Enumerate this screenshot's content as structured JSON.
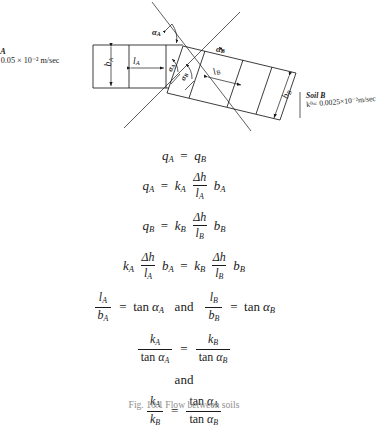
{
  "figure": {
    "caption": "Fig. 10.1   Flow between soils",
    "background": "#ffffff",
    "ink": "#1a1a1a"
  },
  "diagram": {
    "soil_a": {
      "name_line": "il A",
      "perm_line": "= 0.05 × 10⁻² m/sec",
      "full_name": "Soil A",
      "permeability_value": "0.05 × 10⁻² m/sec",
      "clipped_at_left_edge": true
    },
    "soil_b": {
      "name_line": "Soil B",
      "perm_line": "kᴮ= 0.0025×10⁻²m/sec",
      "full_name": "Soil B",
      "permeability_value": "0.0025 × 10⁻² m/sec"
    },
    "dimensions": {
      "b_a": "b",
      "b_a_sub": "A",
      "l_a": "l",
      "l_a_sub": "A",
      "l_b": "l",
      "l_b_sub": "B",
      "b_b": "b",
      "b_b_sub": "B"
    },
    "angles": {
      "alpha_a_top": "α",
      "alpha_a_top_sub": "A",
      "alpha_b_top": "α",
      "alpha_b_top_sub": "B",
      "alpha_a_low": "α",
      "alpha_a_low_sub": "A",
      "alpha_b_low": "α",
      "alpha_b_low_sub": "B"
    }
  },
  "equations": {
    "eq1": {
      "lhs_var": "q",
      "lhs_sub": "A",
      "rhs_var": "q",
      "rhs_sub": "B",
      "sign": "="
    },
    "eq2": {
      "lhs_var": "q",
      "lhs_sub": "A",
      "sign": "=",
      "k_var": "k",
      "k_sub": "A",
      "frac_num": "Δh",
      "frac_den": "l",
      "frac_den_sub": "A",
      "b_var": "b",
      "b_sub": "A"
    },
    "eq3": {
      "lhs_var": "q",
      "lhs_sub": "B",
      "sign": "=",
      "k_var": "k",
      "k_sub": "B",
      "frac_num": "Δh",
      "frac_den": "l",
      "frac_den_sub": "B",
      "b_var": "b",
      "b_sub": "B"
    },
    "eq4": {
      "k_left": "k",
      "k_left_sub": "A",
      "frac_left_num": "Δh",
      "frac_left_den": "l",
      "frac_left_den_sub": "A",
      "b_left": "b",
      "b_left_sub": "A",
      "sign": "=",
      "k_right": "k",
      "k_right_sub": "B",
      "frac_right_num": "Δh",
      "frac_right_den": "l",
      "frac_right_den_sub": "B",
      "b_right": "b",
      "b_right_sub": "B"
    },
    "eq5": {
      "frac_left_num": "l",
      "frac_left_num_sub": "A",
      "frac_left_den": "b",
      "frac_left_den_sub": "A",
      "sign_left": "=",
      "tan_left": "tan",
      "alpha_left": "α",
      "alpha_left_sub": "A",
      "conj": "and",
      "frac_right_num": "l",
      "frac_right_num_sub": "B",
      "frac_right_den": "b",
      "frac_right_den_sub": "B",
      "sign_right": "=",
      "tan_right": "tan",
      "alpha_right": "α",
      "alpha_right_sub": "B"
    },
    "eq6": {
      "left_num": "k",
      "left_num_sub": "A",
      "left_den_tan": "tan",
      "left_den_alpha": "α",
      "left_den_alpha_sub": "A",
      "sign": "=",
      "right_num": "k",
      "right_num_sub": "B",
      "right_den_tan": "tan",
      "right_den_alpha": "α",
      "right_den_alpha_sub": "B"
    },
    "and_line": "and",
    "eq7": {
      "left_num": "k",
      "left_num_sub": "A",
      "left_den": "k",
      "left_den_sub": "B",
      "sign": "=",
      "right_num_tan": "tan",
      "right_num_alpha": "α",
      "right_num_alpha_sub": "A",
      "right_den_tan": "tan",
      "right_den_alpha": "α",
      "right_den_alpha_sub": "B"
    }
  }
}
